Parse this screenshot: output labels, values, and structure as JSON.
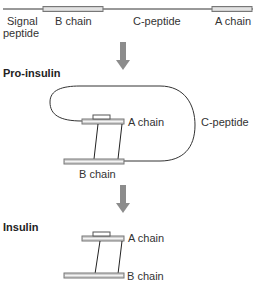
{
  "preproinsulin": {
    "labels": {
      "signal_line1": "Signal",
      "signal_line2": "peptide",
      "b_chain": "B chain",
      "c_peptide": "C-peptide",
      "a_chain": "A chain"
    }
  },
  "proinsulin": {
    "title": "Pro-insulin",
    "labels": {
      "a_chain": "A chain",
      "b_chain": "B chain",
      "c_peptide": "C-peptide"
    }
  },
  "insulin": {
    "title": "Insulin",
    "labels": {
      "a_chain": "A chain",
      "b_chain": "B chain"
    }
  },
  "colors": {
    "line": "#333333",
    "bar_fill": "#c8c8c8",
    "bar_stroke": "#777777",
    "arrow": "#8c8c8c"
  }
}
